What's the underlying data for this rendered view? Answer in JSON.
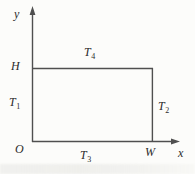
{
  "diagram": {
    "axes": {
      "y_label": "y",
      "x_label": "x",
      "origin_label": "O"
    },
    "dimensions": {
      "height_label": "H",
      "width_label": "W"
    },
    "boundaries": {
      "top": {
        "base": "T",
        "sub": "4"
      },
      "left": {
        "base": "T",
        "sub": "1"
      },
      "right": {
        "base": "T",
        "sub": "2"
      },
      "bottom": {
        "base": "T",
        "sub": "3"
      }
    },
    "colors": {
      "line": "#4f4f4f",
      "text": "#2b2b2b",
      "background": "#fcfcfa"
    }
  }
}
